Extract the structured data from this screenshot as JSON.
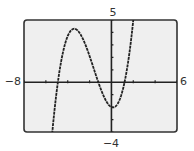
{
  "chart_data": {
    "type": "line",
    "title": "",
    "xlabel": "",
    "ylabel": "",
    "xlim": [
      -8,
      6
    ],
    "ylim": [
      -4,
      5
    ],
    "x_tick_step": 2,
    "y_tick_step": 1,
    "grid": false,
    "legend": null,
    "window_labels": {
      "xmin": "−8",
      "xmax": "6",
      "ymin": "−4",
      "ymax": "5"
    },
    "series": [
      {
        "name": "f(x)",
        "description": "cubic curve with zeros near x ≈ -4.9, -1.2, 1.2; local max ≈ (-3.3, 4.3); local min ≈ (0.1, -2.1)",
        "function": {
          "a": 0.283,
          "roots": [
            -4.9,
            -1.2,
            1.2
          ]
        },
        "x": [
          -5.41,
          -5.0,
          -4.9,
          -4.5,
          -4.0,
          -3.5,
          -3.3,
          -3.0,
          -2.5,
          -2.0,
          -1.5,
          -1.2,
          -1.0,
          -0.5,
          0.0,
          0.2,
          0.5,
          1.0,
          1.2,
          1.5,
          2.0
        ],
        "y": [
          -4.0,
          -0.19,
          0.0,
          1.55,
          2.87,
          3.93,
          4.28,
          4.12,
          3.83,
          2.1,
          1.01,
          0.0,
          -0.49,
          -1.58,
          -2.0,
          -2.03,
          -1.82,
          -1.23,
          0.0,
          1.02,
          5.0
        ]
      }
    ],
    "colors": {
      "plot_background": "#efefef",
      "page_background": "#ffffff",
      "curve": "#222222",
      "axes": "#222222",
      "frame": "#333333"
    }
  }
}
